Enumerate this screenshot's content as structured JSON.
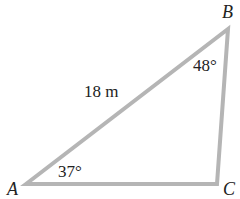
{
  "diagram": {
    "type": "triangle",
    "vertices": {
      "A": {
        "label": "A",
        "x": 26,
        "y": 184
      },
      "B": {
        "label": "B",
        "x": 228,
        "y": 29
      },
      "C": {
        "label": "C",
        "x": 217,
        "y": 184
      }
    },
    "side_labels": {
      "AB": "18 m"
    },
    "angle_labels": {
      "A": "37°",
      "B": "48°"
    },
    "colors": {
      "stroke": "#b5b5b5",
      "text": "#222222",
      "background": "#ffffff"
    }
  }
}
